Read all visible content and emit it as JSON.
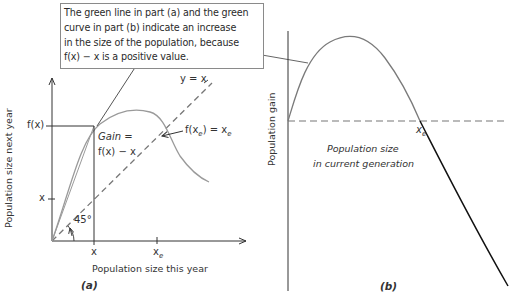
{
  "callout": {
    "lines": [
      "The green line in part (a) and the green",
      "curve in part (b) indicate an increase",
      "in the size of the population, because",
      "f(x) − x is a positive value."
    ]
  },
  "panel_a": {
    "tag": "(a)",
    "x_axis_label": "Population size this year",
    "y_axis_label": "Population size next year",
    "y_ticks": {
      "fx": "f(x)",
      "x": "x"
    },
    "x_ticks": {
      "x": "x",
      "xe_base": "x",
      "xe_sub": "e"
    },
    "line_label": "y = x",
    "gain_label_1": "Gain =",
    "gain_label_2": "f(x) − x",
    "equilibrium_label": {
      "f": "f(x",
      "sub": "e",
      "mid": ") = x",
      "sub2": "e"
    },
    "angle_label": "45°"
  },
  "panel_b": {
    "tag": "(b)",
    "y_axis_label": "Population gain",
    "x_axis_label_1": "Population size",
    "x_axis_label_2": "in current generation",
    "xe_tick": {
      "base": "x",
      "sub": "e"
    }
  },
  "colors": {
    "curve_gray": "#9a9a9a",
    "axis": "#333333",
    "dashed": "#777777",
    "negative_segment": "#111111",
    "callout_border": "#8a8a8a"
  }
}
